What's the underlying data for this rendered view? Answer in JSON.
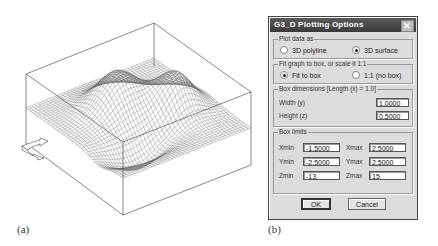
{
  "figure": {
    "panel_a_label": "(a)",
    "panel_b_label": "(b)"
  },
  "plot": {
    "description": "3D wireframe surface with two peaks inside a box",
    "line_color": "#555555"
  },
  "dialog": {
    "title": "G3_D  Plotting  Options",
    "close_icon": "close-icon",
    "plot_data_as": {
      "legend": "Plot data as",
      "options": [
        {
          "label": "3D polyline",
          "selected": false
        },
        {
          "label": "3D surface",
          "selected": true
        }
      ]
    },
    "fit": {
      "legend": "Fit graph to box, or scale it 1:1",
      "options": [
        {
          "label": "Fit to box",
          "selected": true
        },
        {
          "label": "1:1 (no box)",
          "selected": false
        }
      ]
    },
    "box_dimensions": {
      "legend": "Box dimensions [Length (x) = 1.0]",
      "width_label": "Width (y)",
      "width_value": "1.0000",
      "height_label": "Height (z)",
      "height_value": "0.5000"
    },
    "box_limits": {
      "legend": "Box limits",
      "xmin_label": "Xmin",
      "xmin_value": "-1.5000",
      "xmax_label": "Xmax",
      "xmax_value": "2.5000",
      "ymin_label": "Ymin",
      "ymin_value": "-2.5000",
      "ymax_label": "Ymax",
      "ymax_value": "2.5000",
      "zmin_label": "Zmin",
      "zmin_value": "-13",
      "zmax_label": "Zmax",
      "zmax_value": "15"
    },
    "ok_label": "OK",
    "cancel_label": "Cancel"
  }
}
